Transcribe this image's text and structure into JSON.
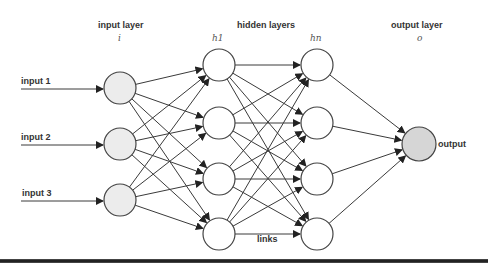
{
  "header": {
    "input_layer": "input layer",
    "input_symbol": "i",
    "hidden_layers": "hidden layers",
    "hidden_first_symbol": "h1",
    "hidden_last_symbol": "hn",
    "output_layer": "output layer",
    "output_symbol": "o"
  },
  "inputs": [
    {
      "label": "input 1"
    },
    {
      "label": "input 2"
    },
    {
      "label": "input 3"
    }
  ],
  "output_label": "output",
  "links_label": "links",
  "layers": {
    "input": {
      "x": 120,
      "r": 16,
      "ys": [
        88,
        144,
        200
      ]
    },
    "hidden1": {
      "x": 219,
      "r": 16,
      "ys": [
        65,
        123,
        179,
        234
      ]
    },
    "hiddenN": {
      "x": 317,
      "r": 16,
      "ys": [
        65,
        123,
        179,
        234
      ]
    },
    "output": {
      "x": 419,
      "r": 17,
      "ys": [
        144
      ]
    }
  },
  "colors": {
    "input_node": "#ececec",
    "hidden_node": "#ffffff",
    "output_node": "#d6d6d6",
    "edge": "#3a3a3a"
  }
}
